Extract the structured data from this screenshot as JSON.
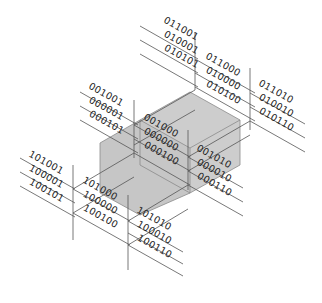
{
  "diagram": {
    "title": "",
    "colors": {
      "background": "#ffffff",
      "line": "#555555",
      "box_fill": "#c8c8c8",
      "box_stroke": "#7a7a7a",
      "text": "#222222"
    },
    "groups": [
      {
        "id": "top",
        "codes": [
          "011001",
          "010001",
          "010101"
        ],
        "origin": [
          165,
          20
        ]
      },
      {
        "id": "top-right",
        "codes": [
          "011000",
          "010000",
          "010100"
        ],
        "origin": [
          207,
          58
        ]
      },
      {
        "id": "right",
        "codes": [
          "011010",
          "010010",
          "010110"
        ],
        "origin": [
          257,
          83
        ]
      },
      {
        "id": "upper-left",
        "codes": [
          "001001",
          "000001",
          "000101"
        ],
        "origin": [
          87,
          90
        ]
      },
      {
        "id": "center",
        "codes": [
          "001000",
          "000000",
          "000100"
        ],
        "origin": [
          143,
          119
        ]
      },
      {
        "id": "center-right",
        "codes": [
          "001010",
          "000010",
          "000110"
        ],
        "origin": [
          196,
          148
        ]
      },
      {
        "id": "left",
        "codes": [
          "101001",
          "100001",
          "100101"
        ],
        "origin": [
          27,
          156
        ]
      },
      {
        "id": "lower-left",
        "codes": [
          "101000",
          "100000",
          "100100"
        ],
        "origin": [
          82,
          180
        ]
      },
      {
        "id": "bottom",
        "codes": [
          "101010",
          "100010",
          "100110"
        ],
        "origin": [
          135,
          210
        ]
      }
    ],
    "labels": {
      "g0": [
        "011001",
        "010001",
        "010101"
      ],
      "g1": [
        "011000",
        "010000",
        "010100"
      ],
      "g2": [
        "011010",
        "010010",
        "010110"
      ],
      "g3": [
        "001001",
        "000001",
        "000101"
      ],
      "g4": [
        "001000",
        "000000",
        "000100"
      ],
      "g5": [
        "001010",
        "000010",
        "000110"
      ],
      "g6": [
        "101001",
        "100001",
        "100101"
      ],
      "g7": [
        "101000",
        "100000",
        "100100"
      ],
      "g8": [
        "101010",
        "100010",
        "100110"
      ]
    }
  }
}
